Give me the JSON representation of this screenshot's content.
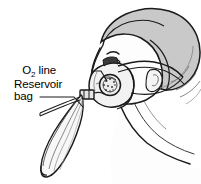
{
  "figure": {
    "labels": [
      {
        "id": "o2-line",
        "text_main": "O",
        "text_sub": "2",
        "text_tail": " line",
        "full": "O2 line",
        "x": 56,
        "y": 74
      },
      {
        "id": "reservoir-bag",
        "line1": "Reservoir",
        "line2": "bag",
        "full": "Reservoir bag",
        "x": 14,
        "y": 88
      }
    ],
    "colors": {
      "outline": "#1a1a1a",
      "hair_fill": "#c9c9c9",
      "hair_shadow": "#b0b0b0",
      "skin_fill": "#fdfdfd",
      "skin_shade": "#e9e9e9",
      "mask_fill": "#f2f2f2",
      "mask_shade": "#d8d8d8",
      "bag_fill": "#f7f7f7",
      "bag_shade": "#e2e2e2",
      "valve_fill": "#ededed",
      "background": "#ffffff",
      "text": "#000000"
    },
    "parts": [
      {
        "id": "hair",
        "name": "hair"
      },
      {
        "id": "face",
        "name": "face-profile"
      },
      {
        "id": "ear",
        "name": "ear"
      },
      {
        "id": "eye",
        "name": "eye"
      },
      {
        "id": "nose",
        "name": "nose"
      },
      {
        "id": "mask",
        "name": "oxygen-mask"
      },
      {
        "id": "valve",
        "name": "one-way-valve"
      },
      {
        "id": "strap",
        "name": "head-strap"
      },
      {
        "id": "reservoir-bag",
        "name": "reservoir-bag"
      },
      {
        "id": "o2-tubing",
        "name": "oxygen-tubing"
      },
      {
        "id": "neck",
        "name": "neck-and-shoulder"
      }
    ]
  }
}
